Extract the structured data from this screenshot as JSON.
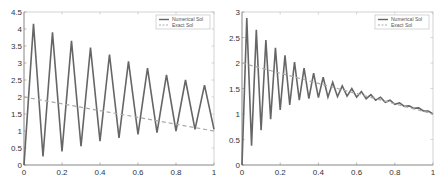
{
  "chart_data": [
    {
      "type": "line",
      "title": "",
      "xlabel": "",
      "ylabel": "",
      "xlim": [
        0,
        1
      ],
      "ylim": [
        0,
        4.5
      ],
      "xticks": [
        "0",
        "0.2",
        "0.4",
        "0.6",
        "0.8",
        "1"
      ],
      "yticks": [
        "0",
        "0.5",
        "1",
        "1.5",
        "2",
        "2.5",
        "3",
        "3.5",
        "4",
        "4.5"
      ],
      "grid": false,
      "legend_position": "upper right",
      "series": [
        {
          "name": "Numerical Sol",
          "style": "solid",
          "color": "#666666",
          "x": [
            0,
            0.05,
            0.1,
            0.15,
            0.2,
            0.25,
            0.3,
            0.35,
            0.4,
            0.45,
            0.5,
            0.55,
            0.6,
            0.65,
            0.7,
            0.75,
            0.8,
            0.85,
            0.9,
            0.95,
            1.0
          ],
          "y": [
            0,
            4.15,
            0.25,
            3.9,
            0.4,
            3.65,
            0.55,
            3.45,
            0.7,
            3.25,
            0.8,
            3.05,
            0.9,
            2.85,
            0.95,
            2.65,
            1.0,
            2.5,
            1.05,
            2.35,
            1.05
          ]
        },
        {
          "name": "Exact Sol",
          "style": "dashed",
          "color": "#aaaaaa",
          "x": [
            0,
            1
          ],
          "y": [
            2,
            1
          ]
        }
      ]
    },
    {
      "type": "line",
      "title": "",
      "xlabel": "",
      "ylabel": "",
      "xlim": [
        0,
        1
      ],
      "ylim": [
        0,
        3
      ],
      "xticks": [
        "0",
        "0.2",
        "0.4",
        "0.6",
        "0.8",
        "1"
      ],
      "yticks": [
        "0",
        "0.5",
        "1",
        "1.5",
        "2",
        "2.5",
        "3"
      ],
      "grid": false,
      "legend_position": "upper right",
      "series": [
        {
          "name": "Numerical Sol",
          "style": "solid",
          "color": "#666666",
          "x": [
            0,
            0.025,
            0.05,
            0.075,
            0.1,
            0.125,
            0.15,
            0.175,
            0.2,
            0.225,
            0.25,
            0.275,
            0.3,
            0.325,
            0.35,
            0.375,
            0.4,
            0.425,
            0.45,
            0.475,
            0.5,
            0.525,
            0.55,
            0.575,
            0.6,
            0.625,
            0.65,
            0.675,
            0.7,
            0.725,
            0.75,
            0.775,
            0.8,
            0.825,
            0.85,
            0.875,
            0.9,
            0.925,
            0.95,
            0.975,
            1.0
          ],
          "y": [
            0,
            2.88,
            0.38,
            2.65,
            0.68,
            2.45,
            0.9,
            2.3,
            1.08,
            2.15,
            1.18,
            2.02,
            1.27,
            1.9,
            1.3,
            1.8,
            1.32,
            1.72,
            1.33,
            1.62,
            1.34,
            1.55,
            1.35,
            1.5,
            1.33,
            1.44,
            1.3,
            1.38,
            1.27,
            1.33,
            1.23,
            1.27,
            1.19,
            1.22,
            1.15,
            1.16,
            1.11,
            1.12,
            1.06,
            1.06,
            1.0
          ]
        },
        {
          "name": "Exact Sol",
          "style": "dashed",
          "color": "#aaaaaa",
          "x": [
            0,
            1
          ],
          "y": [
            2,
            1
          ]
        }
      ]
    }
  ]
}
